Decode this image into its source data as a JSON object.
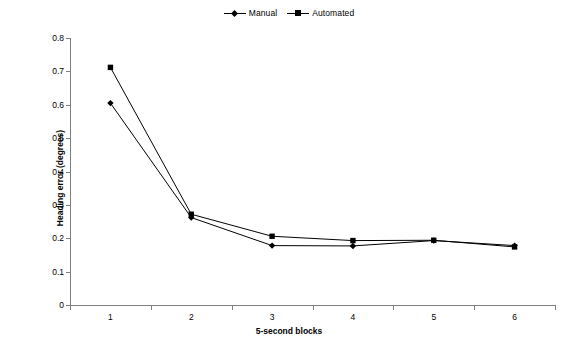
{
  "chart_data": {
    "type": "line",
    "title": "",
    "xlabel": "5-second blocks",
    "ylabel": "Heading error (degrees)",
    "categories": [
      "1",
      "2",
      "3",
      "4",
      "5",
      "6"
    ],
    "x": [
      1,
      2,
      3,
      4,
      5,
      6
    ],
    "ylim": [
      0,
      0.8
    ],
    "ytick_labels": [
      "0",
      "0.1",
      "0.2",
      "0.3",
      "0.4",
      "0.5",
      "0.6",
      "0.7",
      "0.8"
    ],
    "ytick_values": [
      0,
      0.1,
      0.2,
      0.3,
      0.4,
      0.5,
      0.6,
      0.7,
      0.8
    ],
    "grid": false,
    "legend_position": "top-center",
    "series": [
      {
        "name": "Manual",
        "marker": "diamond",
        "color": "#000000",
        "values": [
          0.605,
          0.262,
          0.178,
          0.177,
          0.193,
          0.178
        ]
      },
      {
        "name": "Automated",
        "marker": "square",
        "color": "#000000",
        "values": [
          0.712,
          0.272,
          0.206,
          0.193,
          0.194,
          0.174
        ]
      }
    ]
  },
  "legend": {
    "entries": [
      {
        "label": "Manual"
      },
      {
        "label": "Automated"
      }
    ]
  },
  "axes": {
    "y_title": "Heading error (degrees)",
    "x_title": "5-second blocks"
  },
  "colors": {
    "series": "#000000",
    "axis": "#808080",
    "background": "#ffffff"
  }
}
